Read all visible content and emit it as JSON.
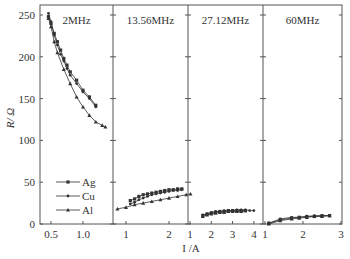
{
  "chart_data": {
    "type": "line",
    "title": "",
    "ylabel": "R/ Ω",
    "xlabel": "I /A",
    "ylim": [
      0,
      260
    ],
    "yticks": [
      0,
      50,
      100,
      150,
      200,
      250
    ],
    "legend": {
      "position": "lower-left of first panel",
      "entries": [
        "Ag",
        "Cu",
        "Al"
      ]
    },
    "panels": [
      {
        "label": "2MHz",
        "xticks": [
          0.5,
          1.0
        ],
        "xtick_labels": [
          "0.5",
          "1.0"
        ],
        "xrange": [
          0.42,
          1.4
        ],
        "series": [
          {
            "name": "Ag",
            "x": [
              0.46,
              0.5,
              0.55,
              0.6,
              0.65,
              0.7,
              0.75,
              0.8,
              0.9,
              1.0,
              1.1,
              1.2
            ],
            "y": [
              248,
              240,
              228,
              218,
              208,
              198,
              190,
              182,
              172,
              160,
              152,
              142
            ]
          },
          {
            "name": "Cu",
            "x": [
              0.46,
              0.5,
              0.55,
              0.6,
              0.65,
              0.7,
              0.75,
              0.8,
              0.9,
              1.0,
              1.1,
              1.2
            ],
            "y": [
              252,
              242,
              226,
              214,
              203,
              195,
              186,
              178,
              168,
              158,
              150,
              140
            ]
          },
          {
            "name": "Al",
            "x": [
              0.46,
              0.5,
              0.55,
              0.6,
              0.7,
              0.8,
              0.9,
              1.0,
              1.1,
              1.2,
              1.3,
              1.35
            ],
            "y": [
              246,
              236,
              218,
              205,
              185,
              168,
              152,
              140,
              130,
              122,
              118,
              116
            ]
          }
        ]
      },
      {
        "label": "13.56MHz",
        "xticks": [
          1,
          2
        ],
        "xtick_labels": [
          "1",
          "2"
        ],
        "xrange": [
          0.7,
          2.5
        ],
        "series": [
          {
            "name": "Ag",
            "x": [
              1.1,
              1.2,
              1.3,
              1.4,
              1.5,
              1.6,
              1.7,
              1.8,
              1.9,
              2.0,
              2.1,
              2.2,
              2.3
            ],
            "y": [
              28,
              30,
              33,
              35,
              36,
              37,
              38,
              39,
              40,
              41,
              41,
              42,
              42
            ]
          },
          {
            "name": "Cu",
            "x": [
              1.1,
              1.2,
              1.3,
              1.4,
              1.5,
              1.6,
              1.7,
              1.8,
              1.9,
              2.0,
              2.1,
              2.2,
              2.3
            ],
            "y": [
              24,
              26,
              29,
              31,
              33,
              35,
              36,
              37,
              38,
              39,
              40,
              40,
              41
            ]
          },
          {
            "name": "Al",
            "x": [
              0.8,
              1.0,
              1.2,
              1.4,
              1.6,
              1.8,
              2.0,
              2.2,
              2.4,
              2.5
            ],
            "y": [
              18,
              20,
              23,
              25,
              27,
              29,
              31,
              33,
              35,
              36
            ]
          }
        ]
      },
      {
        "label": "27.12MHz",
        "xticks": [
          1,
          2,
          3,
          4
        ],
        "xtick_labels": [
          "1",
          "2",
          "3",
          "4"
        ],
        "xrange": [
          0.9,
          4.2
        ],
        "series": [
          {
            "name": "Ag",
            "x": [
              1.6,
              1.8,
              2.0,
              2.2,
              2.4,
              2.6,
              2.8,
              3.0,
              3.2,
              3.4,
              3.6
            ],
            "y": [
              10,
              12,
              13,
              14,
              15,
              15,
              16,
              16,
              16,
              16,
              16
            ]
          },
          {
            "name": "Cu",
            "x": [
              1.6,
              1.8,
              2.0,
              2.2,
              2.4,
              2.6,
              2.8,
              3.0,
              3.2,
              3.4,
              3.6,
              3.8,
              4.0
            ],
            "y": [
              11,
              12,
              14,
              15,
              15,
              16,
              16,
              16,
              17,
              17,
              17,
              16,
              16
            ]
          },
          {
            "name": "Al",
            "x": [
              1.6,
              1.8,
              2.0,
              2.2,
              2.4,
              2.6,
              2.8,
              3.0,
              3.2,
              3.4,
              3.6
            ],
            "y": [
              9,
              11,
              12,
              13,
              14,
              14,
              15,
              15,
              15,
              15,
              16
            ]
          }
        ]
      },
      {
        "label": "60MHz",
        "xticks": [
          1,
          2,
          3
        ],
        "xtick_labels": [
          "1",
          "2",
          "3"
        ],
        "xrange": [
          0.95,
          3.0
        ],
        "series": [
          {
            "name": "Ag",
            "x": [
              1.1,
              1.4,
              1.7,
              1.9,
              2.1,
              2.3,
              2.5,
              2.7
            ],
            "y": [
              1,
              5,
              7,
              8,
              9,
              9,
              10,
              10
            ]
          },
          {
            "name": "Cu",
            "x": [
              1.1,
              1.4,
              1.7,
              1.9,
              2.1,
              2.3,
              2.5,
              2.7
            ],
            "y": [
              1,
              6,
              8,
              8,
              9,
              10,
              10,
              10
            ]
          },
          {
            "name": "Al",
            "x": [
              1.1,
              1.4,
              1.7,
              1.9,
              2.1,
              2.3,
              2.5,
              2.7
            ],
            "y": [
              0,
              4,
              6,
              7,
              8,
              9,
              9,
              10
            ]
          }
        ]
      }
    ]
  },
  "colors": {
    "axis": "#555555",
    "line": "#333333",
    "background": "#ffffff"
  }
}
